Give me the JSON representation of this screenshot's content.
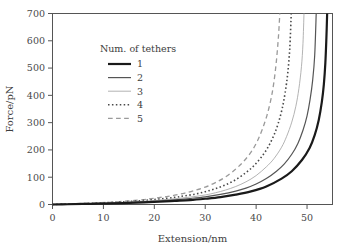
{
  "chart_data": {
    "type": "line",
    "title": "",
    "xlabel": "Extension/nm",
    "ylabel": "Force/pN",
    "xlim": [
      0,
      55
    ],
    "ylim": [
      0,
      700
    ],
    "xticks": [
      0,
      10,
      20,
      30,
      40,
      50
    ],
    "xtick_labels": [
      "0",
      "10",
      "20",
      "30",
      "40",
      "50"
    ],
    "yticks": [
      0,
      100,
      200,
      300,
      400,
      500,
      600,
      700
    ],
    "ytick_labels": [
      "0",
      "100",
      "200",
      "300",
      "400",
      "500",
      "600",
      "700"
    ],
    "grid": false,
    "legend": {
      "title": "Num. of tethers",
      "position": "upper-left-inside",
      "entries": [
        {
          "label": "1",
          "style": "solid",
          "width": 2.2,
          "color": "#1a1a1a"
        },
        {
          "label": "2",
          "style": "solid",
          "width": 1.2,
          "color": "#555555"
        },
        {
          "label": "3",
          "style": "solid",
          "width": 0.9,
          "color": "#aaaaaa"
        },
        {
          "label": "4",
          "style": "dotted",
          "width": 1.6,
          "color": "#4a4a4a"
        },
        {
          "label": "5",
          "style": "dashed",
          "width": 1.3,
          "color": "#9a9a9a"
        }
      ]
    },
    "series": [
      {
        "name": "1",
        "label": "1",
        "style": "solid",
        "width": 2.2,
        "color": "#1a1a1a",
        "contour_length_nm": 54.0,
        "x": [
          0,
          3,
          6,
          9,
          12,
          15,
          18,
          21,
          24,
          27,
          30,
          33,
          36,
          39,
          42,
          45,
          47,
          49,
          50.5,
          51.5,
          52.3,
          52.9,
          53.3,
          53.6,
          53.8,
          53.95
        ],
        "y": [
          0,
          1,
          2,
          3,
          4,
          6,
          8,
          10,
          13,
          16,
          21,
          27,
          36,
          48,
          66,
          95,
          122,
          163,
          207,
          254,
          310,
          375,
          440,
          520,
          610,
          700
        ]
      },
      {
        "name": "2",
        "label": "2",
        "style": "solid",
        "width": 1.2,
        "color": "#555555",
        "contour_length_nm": 52.0,
        "x": [
          0,
          3,
          6,
          9,
          12,
          15,
          18,
          21,
          24,
          27,
          30,
          33,
          36,
          38,
          40,
          42,
          44,
          45.5,
          47,
          48.2,
          49.2,
          50,
          50.6,
          51.1,
          51.5,
          51.8
        ],
        "y": [
          0,
          1,
          2,
          4,
          5,
          7,
          10,
          13,
          17,
          22,
          28,
          37,
          49,
          60,
          75,
          95,
          122,
          148,
          184,
          224,
          272,
          325,
          385,
          455,
          545,
          700
        ]
      },
      {
        "name": "3",
        "label": "3",
        "style": "solid",
        "width": 0.9,
        "color": "#aaaaaa",
        "contour_length_nm": 49.5,
        "x": [
          0,
          3,
          6,
          9,
          12,
          15,
          18,
          21,
          24,
          27,
          30,
          32,
          34,
          36,
          38,
          40,
          42,
          43.5,
          45,
          46,
          47,
          47.8,
          48.4,
          48.9,
          49.2,
          49.4
        ],
        "y": [
          0,
          1,
          3,
          4,
          6,
          9,
          12,
          16,
          21,
          27,
          35,
          43,
          53,
          66,
          83,
          106,
          138,
          168,
          210,
          250,
          302,
          360,
          425,
          505,
          590,
          700
        ]
      },
      {
        "name": "4",
        "label": "4",
        "style": "dotted",
        "width": 1.6,
        "color": "#4a4a4a",
        "contour_length_nm": 47.2,
        "x": [
          0,
          3,
          6,
          9,
          12,
          15,
          18,
          21,
          24,
          26,
          28,
          30,
          32,
          34,
          36,
          38,
          39.5,
          41,
          42.3,
          43.4,
          44.3,
          45.1,
          45.7,
          46.2,
          46.6,
          46.9
        ],
        "y": [
          0,
          2,
          3,
          5,
          8,
          11,
          15,
          20,
          26,
          32,
          38,
          47,
          58,
          72,
          91,
          117,
          141,
          173,
          209,
          250,
          295,
          350,
          410,
          480,
          570,
          700
        ]
      },
      {
        "name": "5",
        "label": "5",
        "style": "dashed",
        "width": 1.3,
        "color": "#9a9a9a",
        "contour_length_nm": 44.8,
        "x": [
          0,
          3,
          6,
          9,
          12,
          15,
          18,
          20,
          22,
          24,
          26,
          28,
          30,
          32,
          34,
          36,
          37.5,
          39,
          40.2,
          41.2,
          42.1,
          42.9,
          43.5,
          44,
          44.4,
          44.65
        ],
        "y": [
          0,
          2,
          4,
          6,
          9,
          13,
          18,
          23,
          28,
          34,
          42,
          52,
          64,
          80,
          101,
          130,
          157,
          192,
          231,
          275,
          325,
          385,
          450,
          530,
          620,
          700
        ]
      }
    ]
  },
  "axes": {
    "x_title": "Extension/nm",
    "y_title": "Force/pN"
  }
}
